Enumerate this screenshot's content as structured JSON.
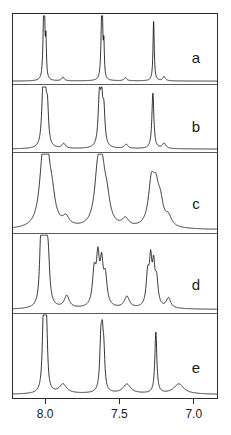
{
  "figure": {
    "kind": "stacked-nmr-spectra",
    "panel_count": 5,
    "line_color": "#111111",
    "frame_color": "#2b2b2b",
    "background": "#ffffff"
  },
  "axis": {
    "label": "",
    "tick_labels": [
      "8.0",
      "7.5",
      "7.0"
    ],
    "tick_values": [
      8.0,
      7.5,
      7.0
    ],
    "x_min_ppm": 6.84,
    "x_max_ppm": 8.22,
    "direction": "decreasing-left-to-right"
  },
  "panels": [
    {
      "letter": "a",
      "broadening": "sharp"
    },
    {
      "letter": "b",
      "broadening": "sharp"
    },
    {
      "letter": "c",
      "broadening": "moderate"
    },
    {
      "letter": "d",
      "broadening": "strong"
    },
    {
      "letter": "e",
      "broadening": "sharp"
    }
  ],
  "chart_data": {
    "type": "line",
    "title": "",
    "subtitle": "",
    "xlabel": "",
    "ylabel": "",
    "xlim": [
      8.22,
      6.84
    ],
    "grid": false,
    "legend": "none",
    "tick_labels": [
      "8.0",
      "7.5",
      "7.0"
    ],
    "ticks": [
      8.0,
      7.5,
      7.0
    ],
    "annotations": [
      "a",
      "b",
      "c",
      "d",
      "e"
    ],
    "series": [
      {
        "name": "a",
        "label": "a",
        "linewidth_ppm": 0.006,
        "baseline": 0.04,
        "peaks": [
          {
            "ppm": 8.01,
            "height": 0.92,
            "width": 0.006
          },
          {
            "ppm": 8.005,
            "height": 0.7,
            "width": 0.004
          },
          {
            "ppm": 7.995,
            "height": 0.58,
            "width": 0.004
          },
          {
            "ppm": 7.62,
            "height": 0.84,
            "width": 0.006
          },
          {
            "ppm": 7.615,
            "height": 0.66,
            "width": 0.004
          },
          {
            "ppm": 7.605,
            "height": 0.52,
            "width": 0.004
          },
          {
            "ppm": 7.27,
            "height": 0.96,
            "width": 0.005
          },
          {
            "ppm": 7.88,
            "height": 0.06,
            "width": 0.01
          },
          {
            "ppm": 7.46,
            "height": 0.05,
            "width": 0.01
          },
          {
            "ppm": 7.2,
            "height": 0.07,
            "width": 0.01
          }
        ]
      },
      {
        "name": "b",
        "label": "b",
        "linewidth_ppm": 0.01,
        "baseline": 0.05,
        "peaks": [
          {
            "ppm": 8.015,
            "height": 0.9,
            "width": 0.01
          },
          {
            "ppm": 8.0,
            "height": 0.78,
            "width": 0.009
          },
          {
            "ppm": 7.985,
            "height": 0.62,
            "width": 0.009
          },
          {
            "ppm": 7.635,
            "height": 0.8,
            "width": 0.01
          },
          {
            "ppm": 7.62,
            "height": 0.7,
            "width": 0.009
          },
          {
            "ppm": 7.605,
            "height": 0.56,
            "width": 0.009
          },
          {
            "ppm": 7.275,
            "height": 0.94,
            "width": 0.008
          },
          {
            "ppm": 7.875,
            "height": 0.08,
            "width": 0.014
          },
          {
            "ppm": 7.455,
            "height": 0.07,
            "width": 0.014
          },
          {
            "ppm": 7.2,
            "height": 0.09,
            "width": 0.014
          }
        ]
      },
      {
        "name": "c",
        "label": "c",
        "linewidth_ppm": 0.03,
        "baseline": 0.07,
        "peaks": [
          {
            "ppm": 8.015,
            "height": 0.88,
            "width": 0.028
          },
          {
            "ppm": 7.985,
            "height": 0.62,
            "width": 0.022
          },
          {
            "ppm": 7.955,
            "height": 0.36,
            "width": 0.026
          },
          {
            "ppm": 7.645,
            "height": 0.76,
            "width": 0.026
          },
          {
            "ppm": 7.615,
            "height": 0.55,
            "width": 0.022
          },
          {
            "ppm": 7.585,
            "height": 0.34,
            "width": 0.026
          },
          {
            "ppm": 7.285,
            "height": 0.58,
            "width": 0.024
          },
          {
            "ppm": 7.255,
            "height": 0.42,
            "width": 0.022
          },
          {
            "ppm": 7.225,
            "height": 0.3,
            "width": 0.024
          },
          {
            "ppm": 7.86,
            "height": 0.12,
            "width": 0.026
          },
          {
            "ppm": 7.46,
            "height": 0.11,
            "width": 0.026
          },
          {
            "ppm": 7.17,
            "height": 0.13,
            "width": 0.024
          }
        ]
      },
      {
        "name": "d",
        "label": "d",
        "linewidth_ppm": 0.018,
        "baseline": 0.1,
        "peaks": [
          {
            "ppm": 8.03,
            "height": 0.78,
            "width": 0.01
          },
          {
            "ppm": 8.012,
            "height": 0.88,
            "width": 0.01
          },
          {
            "ppm": 7.996,
            "height": 0.8,
            "width": 0.01
          },
          {
            "ppm": 7.98,
            "height": 0.62,
            "width": 0.012
          },
          {
            "ppm": 7.67,
            "height": 0.48,
            "width": 0.014
          },
          {
            "ppm": 7.645,
            "height": 0.62,
            "width": 0.012
          },
          {
            "ppm": 7.62,
            "height": 0.54,
            "width": 0.012
          },
          {
            "ppm": 7.595,
            "height": 0.4,
            "width": 0.014
          },
          {
            "ppm": 7.31,
            "height": 0.44,
            "width": 0.012
          },
          {
            "ppm": 7.29,
            "height": 0.58,
            "width": 0.01
          },
          {
            "ppm": 7.27,
            "height": 0.5,
            "width": 0.01
          },
          {
            "ppm": 7.25,
            "height": 0.36,
            "width": 0.012
          },
          {
            "ppm": 7.855,
            "height": 0.17,
            "width": 0.02
          },
          {
            "ppm": 7.45,
            "height": 0.16,
            "width": 0.02
          },
          {
            "ppm": 7.17,
            "height": 0.14,
            "width": 0.018
          }
        ]
      },
      {
        "name": "e",
        "label": "e",
        "linewidth_ppm": 0.009,
        "baseline": 0.1,
        "peaks": [
          {
            "ppm": 8.012,
            "height": 0.86,
            "width": 0.009
          },
          {
            "ppm": 8.0,
            "height": 0.76,
            "width": 0.008
          },
          {
            "ppm": 7.99,
            "height": 0.6,
            "width": 0.008
          },
          {
            "ppm": 7.625,
            "height": 0.62,
            "width": 0.009
          },
          {
            "ppm": 7.615,
            "height": 0.52,
            "width": 0.008
          },
          {
            "ppm": 7.605,
            "height": 0.42,
            "width": 0.008
          },
          {
            "ppm": 7.255,
            "height": 0.8,
            "width": 0.008
          },
          {
            "ppm": 7.88,
            "height": 0.12,
            "width": 0.03
          },
          {
            "ppm": 7.45,
            "height": 0.12,
            "width": 0.03
          },
          {
            "ppm": 7.1,
            "height": 0.13,
            "width": 0.04
          }
        ]
      }
    ]
  }
}
